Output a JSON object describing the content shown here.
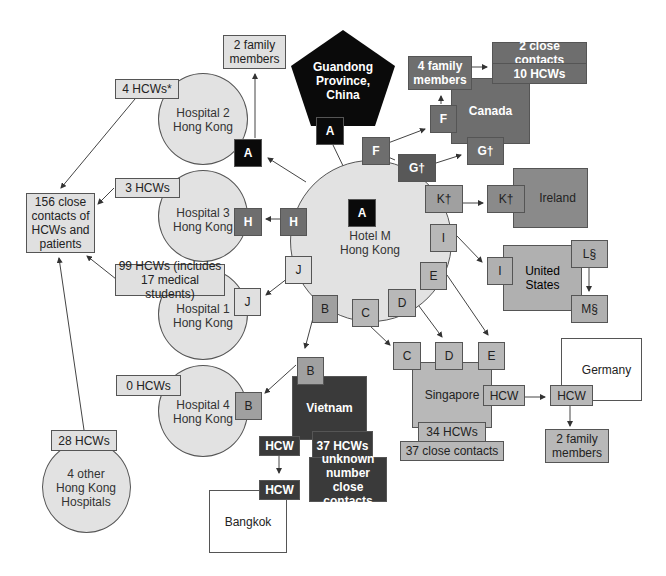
{
  "diagram": {
    "type": "transmission-chain",
    "source": {
      "label": "Guandong Province, China",
      "case": "A"
    },
    "hub": {
      "label_line1": "Hotel M",
      "label_line2": "Hong Kong",
      "case": "A"
    },
    "hotel_cases": [
      "F",
      "G†",
      "K†",
      "I",
      "E",
      "D",
      "C",
      "B",
      "J",
      "H"
    ],
    "hospitals": [
      {
        "id": "h2",
        "line1": "Hospital 2",
        "line2": "Hong Kong",
        "case": "A",
        "hcw": "4 HCWs*"
      },
      {
        "id": "h3",
        "line1": "Hospital 3",
        "line2": "Hong Kong",
        "case": "H",
        "hcw": "3 HCWs"
      },
      {
        "id": "h1",
        "line1": "Hospital 1",
        "line2": "Hong Kong",
        "case": "J",
        "hcw_line1": "99 HCWs (includes",
        "hcw_line2": "17 medical students)"
      },
      {
        "id": "h4",
        "line1": "Hospital 4",
        "line2": "Hong Kong",
        "case": "B",
        "hcw": "0 HCWs"
      },
      {
        "id": "hother",
        "line1": "4 other",
        "line2": "Hong Kong",
        "line3": "Hospitals",
        "hcw": "28 HCWs"
      }
    ],
    "h2_family": {
      "line1": "2 family",
      "line2": "members"
    },
    "close_contacts": {
      "line1": "156 close",
      "line2": "contacts of",
      "line3": "HCWs and",
      "line4": "patients"
    },
    "canada": {
      "label": "Canada",
      "case_f": "F",
      "case_g": "G†",
      "family": {
        "line1": "4 family",
        "line2": "members"
      },
      "close_contacts": "2 close contacts",
      "hcw": "10 HCWs"
    },
    "ireland": {
      "label": "Ireland",
      "case": "K†"
    },
    "usa": {
      "line1": "United",
      "line2": "States",
      "case_i": "I",
      "case_l": "L§",
      "case_m": "M§"
    },
    "singapore": {
      "label": "Singapore",
      "cases": [
        "C",
        "D",
        "E"
      ],
      "hcw_case": "HCW",
      "hcw": "34 HCWs",
      "close_contacts": "37 close contacts"
    },
    "germany": {
      "label": "Germany",
      "hcw_case": "HCW",
      "family": {
        "line1": "2 family",
        "line2": "members"
      }
    },
    "vietnam": {
      "label": "Vietnam",
      "case": "B",
      "hcw_case": "HCW",
      "hcw": "37 HCWs",
      "unknown": {
        "line1": "unknown",
        "line2": "number",
        "line3": "close contacts"
      }
    },
    "bangkok": {
      "label": "Bangkok",
      "hcw_case": "HCW"
    }
  },
  "colors": {
    "circle_fill": "#e2e2e2",
    "light_box": "#e0e0e0",
    "mid_box": "#b8b8b8",
    "canada": "#6e6e6e",
    "ireland": "#8a8a8a",
    "usa": "#b0b0b0",
    "vietnam": "#3a3a3a",
    "source_black": "#0a0a0a"
  }
}
